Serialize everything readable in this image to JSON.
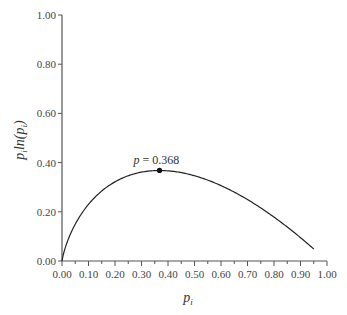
{
  "chart_data": {
    "type": "line",
    "title": "",
    "xlabel": "p_i",
    "ylabel": "p_i ln(p_i)",
    "xlim": [
      0,
      1
    ],
    "ylim": [
      0,
      1
    ],
    "grid": false,
    "xticks": [
      "0.00",
      "0.10",
      "0.20",
      "0.30",
      "0.40",
      "0.50",
      "0.60",
      "0.70",
      "0.80",
      "0.90",
      "1.00"
    ],
    "yticks": [
      "0.00",
      "0.20",
      "0.40",
      "0.60",
      "0.80",
      "1.00"
    ],
    "series": [
      {
        "name": "-p ln(p)",
        "function": "-p*ln(p)",
        "x_range": [
          0.0,
          0.95
        ],
        "x": [
          0.0,
          0.05,
          0.1,
          0.15,
          0.2,
          0.25,
          0.3,
          0.368,
          0.4,
          0.5,
          0.6,
          0.7,
          0.8,
          0.9,
          0.95
        ],
        "values": [
          0.0,
          0.15,
          0.23,
          0.285,
          0.322,
          0.347,
          0.361,
          0.368,
          0.367,
          0.347,
          0.306,
          0.25,
          0.179,
          0.095,
          0.049
        ]
      }
    ],
    "annotations": [
      {
        "text": "p = 0.368",
        "x": 0.368,
        "y": 0.368,
        "marker": "dot"
      }
    ]
  },
  "labels": {
    "xlabel_main": "p",
    "xlabel_sub": "i",
    "ylabel_text": "p",
    "ylabel_sub": "i",
    "ylabel_ln": "ln(",
    "ylabel_p": "p",
    "ylabel_sub2": "i",
    "ylabel_close": ")",
    "annotation": "p = 0.368",
    "annotation_p": "p",
    "annotation_rest": " = 0.368"
  }
}
